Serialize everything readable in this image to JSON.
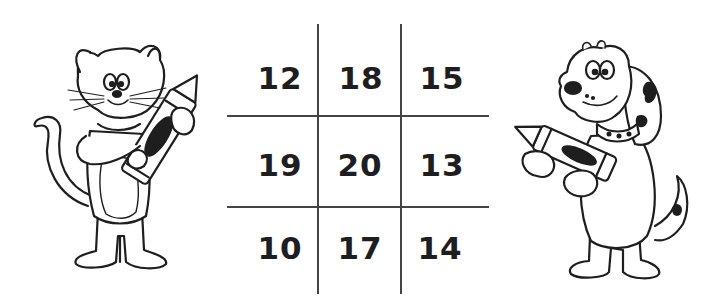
{
  "worksheet": {
    "grid": {
      "rows": [
        [
          "12",
          "18",
          "15"
        ],
        [
          "19",
          "20",
          "13"
        ],
        [
          "10",
          "17",
          "14"
        ]
      ]
    },
    "illustrations": {
      "left": "cat-holding-crayon",
      "right": "dog-holding-crayon"
    },
    "colors": {
      "ink": "#1e1e1e",
      "grid_line": "#444444",
      "background": "#ffffff"
    }
  }
}
